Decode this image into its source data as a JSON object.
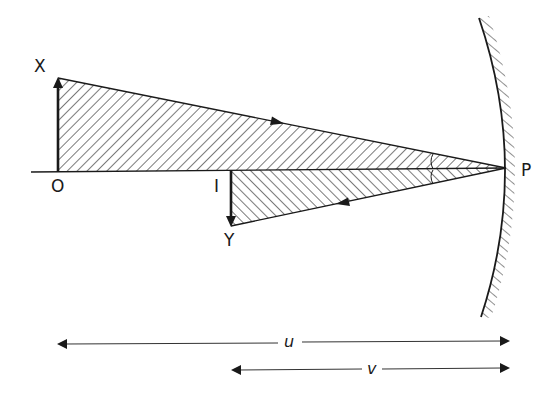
{
  "diagram": {
    "type": "concave-mirror-ray-diagram",
    "points": {
      "X": {
        "label": "X"
      },
      "O": {
        "label": "O"
      },
      "I": {
        "label": "I"
      },
      "Y": {
        "label": "Y"
      },
      "P": {
        "label": "P"
      }
    },
    "distances": {
      "u": {
        "label": "u"
      },
      "v": {
        "label": "v"
      }
    },
    "colors": {
      "line": "#1a1a1a",
      "hatch": "#333333",
      "background": "#ffffff"
    }
  }
}
